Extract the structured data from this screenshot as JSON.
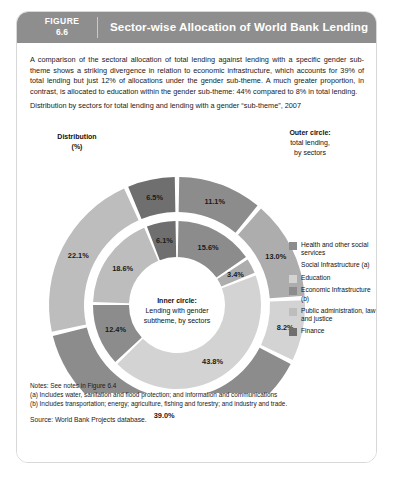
{
  "header": {
    "figure_label": "FIGURE",
    "figure_number": "6.6",
    "title": "Sector-wise Allocation of World Bank Lending"
  },
  "intro_paragraph": "A comparison of the sectoral allocation of total lending against lending with a specific gender sub-theme shows a striking divergence in relation to economic infrastructure, which accounts for 39% of total lending but just 12% of allocations under the gender sub-theme. A much greater proportion, in contrast, is allocated to education within the gender sub-theme: 44% compared to 8% in total lending.",
  "sub_caption": "Distribution by sectors for total lending and lending with a gender “sub-theme”, 2007",
  "labels": {
    "distribution_line1": "Distribution",
    "distribution_line2": "(%)",
    "outer_line1": "Outer circle:",
    "outer_line2": "total lending,",
    "outer_line3": "by sectors",
    "inner_line1": "Inner circle:",
    "inner_line2": "Lending with gender",
    "inner_line3": "subtheme, by sectors"
  },
  "legend": {
    "items": [
      {
        "label": "Health and other social services",
        "color": "#8c8c8c"
      },
      {
        "label": "Social Infrastructure (a)",
        "color": "#adadad"
      },
      {
        "label": "Education",
        "color": "#d3d3d3"
      },
      {
        "label": "Economic Infrastructure (b)",
        "color": "#8c8c8c"
      },
      {
        "label": "Public administration, law and justice",
        "color": "#bdbdbd"
      },
      {
        "label": "Finance",
        "color": "#6f6f6f"
      }
    ]
  },
  "notes": {
    "line1": "Notes: See notes in Figure 6.4",
    "line2": "(a) Includes water, sanitation and flood protection; and information and communications",
    "line3": "(b) Includes transportation; energy; agriculture, fishing and forestry; and industry and trade.",
    "source": "Source: World Bank Projects database."
  },
  "chart_data": {
    "type": "pie",
    "title": "Distribution by sectors for total lending and lending with a gender “sub-theme”, 2007",
    "unit": "%",
    "legend_position": "right",
    "rings": [
      {
        "name": "Outer circle: total lending, by sectors",
        "ring": "outer",
        "categories": [
          "Health and other social services",
          "Social Infrastructure (a)",
          "Education",
          "Economic Infrastructure (b)",
          "Public administration, law and justice",
          "Finance"
        ],
        "values": [
          11.1,
          13.0,
          8.2,
          39.0,
          22.1,
          6.5
        ],
        "labels": [
          "11.1%",
          "13.0%",
          "8.2%",
          "39.0%",
          "22.1%",
          "6.5%"
        ],
        "colors": [
          "#8c8c8c",
          "#adadad",
          "#d3d3d3",
          "#8c8c8c",
          "#bdbdbd",
          "#6f6f6f"
        ]
      },
      {
        "name": "Inner circle: lending with gender subtheme, by sectors",
        "ring": "inner",
        "categories": [
          "Health and other social services",
          "Social Infrastructure (a)",
          "Education",
          "Economic Infrastructure (b)",
          "Public administration, law and justice",
          "Finance"
        ],
        "values": [
          15.6,
          3.4,
          43.8,
          12.4,
          18.6,
          6.1
        ],
        "labels": [
          "15.6%",
          "3.4%",
          "43.8%",
          "12.4%",
          "18.6%",
          "6.1%"
        ],
        "colors": [
          "#8c8c8c",
          "#adadad",
          "#d3d3d3",
          "#8c8c8c",
          "#bdbdbd",
          "#6f6f6f"
        ]
      }
    ]
  },
  "theme": {
    "header_bg": "#8e8e8e",
    "header_text": "#ffffff",
    "page_bg": "#ffffff",
    "border": "#d8d8d8"
  }
}
